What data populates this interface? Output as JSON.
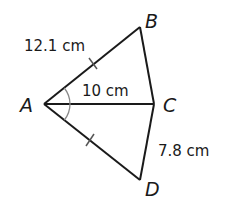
{
  "diagram": {
    "type": "geometry-figure",
    "vertices": [
      {
        "name": "A",
        "label": "A"
      },
      {
        "name": "B",
        "label": "B"
      },
      {
        "name": "C",
        "label": "C"
      },
      {
        "name": "D",
        "label": "D"
      }
    ],
    "segments": [
      "AB",
      "BC",
      "AC",
      "AD",
      "CD"
    ],
    "measurements": {
      "AB": "12.1 cm",
      "AC": "10 cm",
      "CD": "7.8 cm"
    },
    "markings": {
      "congruent_segments": [
        "AB",
        "AD"
      ],
      "congruent_angles": [
        "BAC",
        "CAD"
      ]
    },
    "colors": {
      "line": "#1a1a1a",
      "angle_arc": "#888888",
      "background": "#ffffff"
    }
  }
}
